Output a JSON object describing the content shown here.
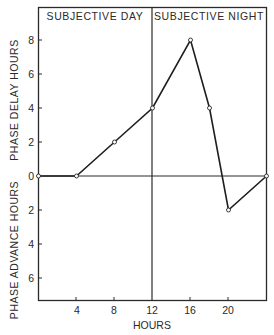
{
  "chart_data": {
    "type": "line",
    "title": "",
    "xlabel": "HOURS",
    "ylabel_top": "PHASE DELAY HOURS",
    "ylabel_bottom": "PHASE ADVANCE HOURS",
    "region_labels": [
      "SUBJECTIVE DAY",
      "SUBJECTIVE NIGHT"
    ],
    "region_divider_x": 12,
    "x_ticks": [
      4,
      8,
      12,
      16,
      20
    ],
    "y_ticks_delay": [
      8,
      6,
      4,
      2
    ],
    "y_tick_zero": 0,
    "y_ticks_advance": [
      2,
      4,
      6
    ],
    "xlim": [
      0,
      24
    ],
    "ylim": [
      -7.3,
      9.8
    ],
    "grid": false,
    "legend": null,
    "series": [
      {
        "name": "phase response",
        "x": [
          0,
          4,
          8,
          12,
          16,
          18,
          20,
          24
        ],
        "values": [
          0,
          0,
          2,
          4,
          8,
          4,
          -2,
          0
        ]
      }
    ],
    "note": "Positive values = phase delay, negative values = phase advance (plotted below zero line, labeled as positive advance hours)"
  },
  "labels": {
    "x_axis": "HOURS",
    "y_top": "PHASE DELAY HOURS",
    "y_bottom": "PHASE ADVANCE HOURS",
    "day": "SUBJECTIVE DAY",
    "night": "SUBJECTIVE NIGHT",
    "xt": [
      "4",
      "8",
      "12",
      "16",
      "20"
    ],
    "yt_delay": [
      "8",
      "6",
      "4",
      "2"
    ],
    "yt_zero": "0",
    "yt_advance": [
      "2",
      "4",
      "6"
    ]
  },
  "colors": {
    "ink": "#2a2a2a",
    "background": "#ffffff"
  }
}
